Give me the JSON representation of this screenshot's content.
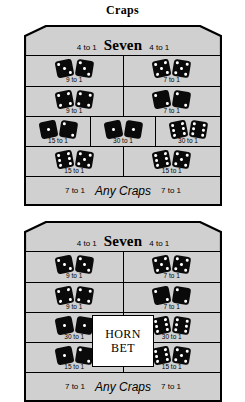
{
  "page": {
    "title": "Craps"
  },
  "layouts": [
    {
      "id": "layout-top",
      "name": "craps-proposition-layout-standard",
      "header": {
        "left_odds": "4 to 1",
        "title": "Seven",
        "right_odds": "4 to 1"
      },
      "has_horn_bet": false,
      "rows": [
        {
          "name": "hardways-row-1",
          "cells": [
            {
              "name": "hard-six",
              "dice": [
                3,
                3
              ],
              "odds": "9 to 1"
            },
            {
              "name": "hard-ten",
              "dice": [
                5,
                5
              ],
              "odds": "7 to 1"
            }
          ]
        },
        {
          "name": "hardways-row-2",
          "cells": [
            {
              "name": "hard-eight",
              "dice": [
                4,
                4
              ],
              "odds": "9 to 1"
            },
            {
              "name": "hard-four",
              "dice": [
                2,
                2
              ],
              "odds": "7 to 1"
            }
          ]
        },
        {
          "name": "craps-row-3",
          "cells": [
            {
              "name": "three-ace-deuce",
              "dice": [
                1,
                2
              ],
              "odds": "15 to 1"
            },
            {
              "name": "two-snake-eyes",
              "dice": [
                1,
                1
              ],
              "odds": "30 to 1"
            },
            {
              "name": "twelve-boxcars",
              "dice": [
                6,
                6
              ],
              "odds": "30 to 1"
            }
          ]
        },
        {
          "name": "eleven-row-4",
          "cells": [
            {
              "name": "eleven-yo-left",
              "dice": [
                6,
                5
              ],
              "odds": "15 to 1"
            },
            {
              "name": "eleven-yo-right",
              "dice": [
                6,
                5
              ],
              "odds": "15 to 1"
            }
          ]
        }
      ],
      "footer": {
        "left_odds": "7 to 1",
        "title": "Any Craps",
        "right_odds": "7 to 1"
      }
    },
    {
      "id": "layout-bottom",
      "name": "craps-proposition-layout-horn",
      "header": {
        "left_odds": "4 to 1",
        "title": "Seven",
        "right_odds": "4 to 1"
      },
      "has_horn_bet": true,
      "horn_bet": {
        "line1": "HORN",
        "line2": "BET"
      },
      "rows": [
        {
          "name": "hardways-row-1",
          "cells": [
            {
              "name": "hard-six",
              "dice": [
                3,
                3
              ],
              "odds": "9 to 1"
            },
            {
              "name": "hard-ten",
              "dice": [
                5,
                5
              ],
              "odds": "7 to 1"
            }
          ]
        },
        {
          "name": "hardways-row-2",
          "cells": [
            {
              "name": "hard-eight",
              "dice": [
                4,
                4
              ],
              "odds": "9 to 1"
            },
            {
              "name": "hard-four",
              "dice": [
                2,
                2
              ],
              "odds": "7 to 1"
            }
          ]
        },
        {
          "name": "horn-row-3",
          "cells": [
            {
              "name": "two-snake-eyes",
              "dice": [
                1,
                1
              ],
              "odds": "30 to 1"
            },
            {
              "name": "twelve-boxcars",
              "dice": [
                6,
                6
              ],
              "odds": "30 to 1"
            }
          ]
        },
        {
          "name": "horn-row-4",
          "cells": [
            {
              "name": "three-ace-deuce",
              "dice": [
                1,
                2
              ],
              "odds": "15 to 1"
            },
            {
              "name": "eleven-yo",
              "dice": [
                6,
                5
              ],
              "odds": "15 to 1"
            }
          ]
        }
      ],
      "footer": {
        "left_odds": "7 to 1",
        "title": "Any Craps",
        "right_odds": "7 to 1"
      }
    }
  ],
  "colors": {
    "felt": "#d0d0d0",
    "ink": "#000000",
    "die_face": "#0a0a0a",
    "pip": "#ffffff",
    "horn_box_fill": "#ffffff"
  }
}
